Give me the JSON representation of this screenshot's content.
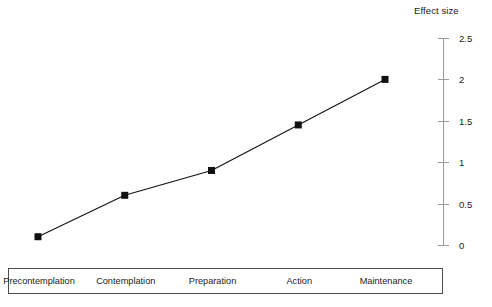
{
  "chart_data": {
    "type": "line",
    "title": "",
    "subtitle": "",
    "xlabel": "",
    "ylabel": "Effect size",
    "ylim": [
      0,
      2.5
    ],
    "xlim": [
      0,
      4
    ],
    "grid": false,
    "legend_position": "bottom-box",
    "categories": [
      "Precontemplation",
      "Contemplation",
      "Preparation",
      "Action",
      "Maintenance"
    ],
    "values": [
      0.1,
      0.6,
      0.9,
      1.45,
      2.0
    ],
    "y_ticks": [
      "0",
      "0.5",
      "1",
      "1.5",
      "2",
      "2.5"
    ],
    "y_tick_values": [
      0,
      0.5,
      1,
      1.5,
      2,
      2.5
    ],
    "marker": "filled-square",
    "line_color": "#111111",
    "marker_color": "#111111",
    "axis_color": "#9a9a9a",
    "box_border_color": "#4d4d4d",
    "background_color": "#ffffff"
  },
  "axis": {
    "title": "Effect size"
  }
}
